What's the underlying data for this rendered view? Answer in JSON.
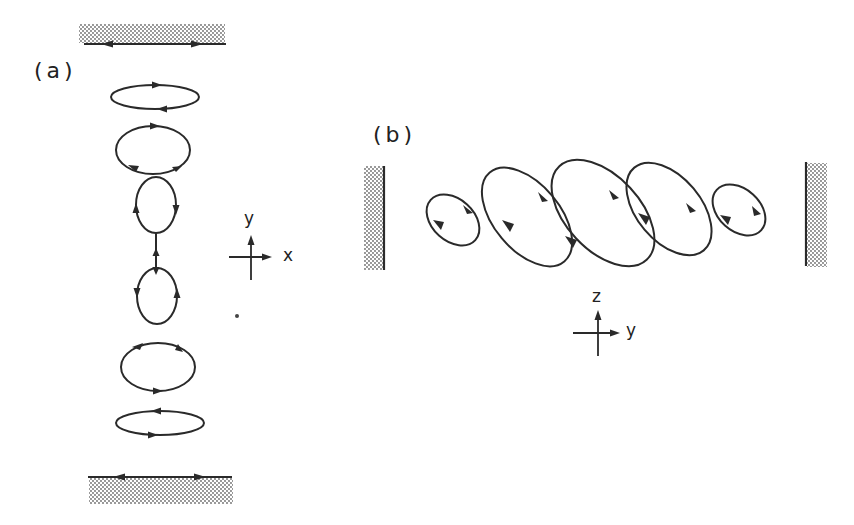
{
  "figure": {
    "panel_a": {
      "label": "(a)",
      "axis_labels": {
        "vertical": "y",
        "horizontal": "x"
      },
      "walls": [
        "top",
        "bottom"
      ],
      "cells": [
        {
          "cx": 155,
          "cy": 124,
          "rx": 44,
          "ry": 12
        },
        {
          "cx": 155,
          "cy": 150,
          "rx": 37,
          "ry": 24
        },
        {
          "cx": 156,
          "cy": 205,
          "rx": 20,
          "ry": 28
        },
        {
          "cx": 157,
          "cy": 313,
          "rx": 20,
          "ry": 28
        },
        {
          "cx": 158,
          "cy": 368,
          "rx": 37,
          "ry": 24
        },
        {
          "cx": 160,
          "cy": 423,
          "rx": 44,
          "ry": 12
        }
      ]
    },
    "panel_b": {
      "label": "(b)",
      "axis_labels": {
        "vertical": "z",
        "horizontal": "y"
      },
      "walls": [
        "left",
        "right"
      ],
      "cells": [
        {
          "cx": 452,
          "cy": 220,
          "rx": 30,
          "ry": 22,
          "rot": 35
        },
        {
          "cx": 527,
          "cy": 219,
          "rx": 54,
          "ry": 34,
          "rot": 48
        },
        {
          "cx": 603,
          "cy": 215,
          "rx": 62,
          "ry": 38,
          "rot": 48
        },
        {
          "cx": 670,
          "cy": 213,
          "rx": 52,
          "ry": 33,
          "rot": 50
        },
        {
          "cx": 738,
          "cy": 210,
          "rx": 30,
          "ry": 22,
          "rot": 38
        }
      ]
    },
    "colors": {
      "ink": "#2a2a2a",
      "background": "#ffffff",
      "hatch": "#7a7a7a"
    }
  }
}
